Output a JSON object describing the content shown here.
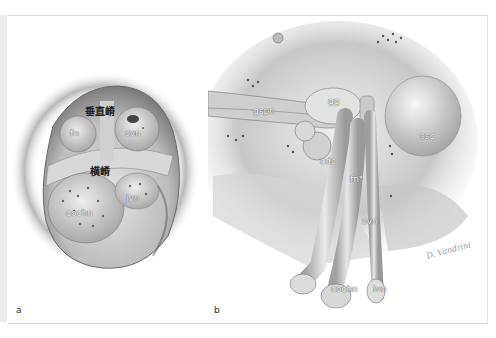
{
  "figure": {
    "panels": [
      {
        "letter": "a",
        "labels": {
          "vertical_crest": "垂直嵴",
          "transverse_crest": "横嵴",
          "fn": "fn",
          "svn": "svn",
          "cochn": "cochn",
          "ivn": "ivn"
        }
      },
      {
        "letter": "b",
        "labels": {
          "gspn": "gspn",
          "gg": "gg",
          "ssc": "ssc",
          "cdc": "cdc",
          "fn": "fn*",
          "svn": "svn",
          "cochn": "cochn",
          "ivn": "ivn"
        },
        "signature": "D. Vandrini"
      }
    ]
  },
  "colors": {
    "background": "#ffffff",
    "frame_border": "#d8d8d8",
    "bone_light": "#e8e8e8",
    "bone_mid": "#b8b8b8",
    "bone_dark": "#6a6a6a"
  }
}
